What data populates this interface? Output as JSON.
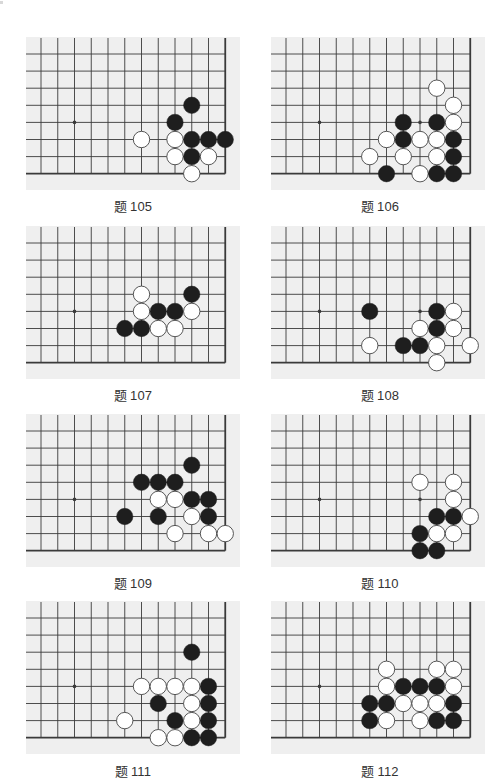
{
  "page": {
    "colors": {
      "board_bg": "#efefef",
      "grid": "#3a3a3a",
      "black_stone": "#1e1e1e",
      "white_stone": "#ffffff",
      "white_stone_border": "#444444",
      "label": "#333333"
    }
  },
  "board_spec": {
    "columns": 12,
    "rows": 8,
    "edges": [
      "right",
      "bottom"
    ],
    "star_points": [
      [
        2,
        4
      ]
    ]
  },
  "problems": [
    {
      "title_prefix": "题",
      "number": "105",
      "extra_dots": [],
      "stones": [
        {
          "c": 9,
          "r": 3,
          "color": "black"
        },
        {
          "c": 8,
          "r": 4,
          "color": "black"
        },
        {
          "c": 6,
          "r": 5,
          "color": "white"
        },
        {
          "c": 8,
          "r": 5,
          "color": "white"
        },
        {
          "c": 9,
          "r": 5,
          "color": "black"
        },
        {
          "c": 10,
          "r": 5,
          "color": "black"
        },
        {
          "c": 11,
          "r": 5,
          "color": "black"
        },
        {
          "c": 8,
          "r": 6,
          "color": "white"
        },
        {
          "c": 9,
          "r": 6,
          "color": "black"
        },
        {
          "c": 10,
          "r": 6,
          "color": "white"
        },
        {
          "c": 9,
          "r": 7,
          "color": "white"
        }
      ]
    },
    {
      "title_prefix": "题",
      "number": "106",
      "extra_dots": [
        [
          8,
          4
        ]
      ],
      "stones": [
        {
          "c": 9,
          "r": 2,
          "color": "white"
        },
        {
          "c": 10,
          "r": 3,
          "color": "white"
        },
        {
          "c": 7,
          "r": 4,
          "color": "black"
        },
        {
          "c": 9,
          "r": 4,
          "color": "black"
        },
        {
          "c": 10,
          "r": 4,
          "color": "white"
        },
        {
          "c": 6,
          "r": 5,
          "color": "white"
        },
        {
          "c": 7,
          "r": 5,
          "color": "black"
        },
        {
          "c": 8,
          "r": 5,
          "color": "white"
        },
        {
          "c": 9,
          "r": 5,
          "color": "white"
        },
        {
          "c": 10,
          "r": 5,
          "color": "black"
        },
        {
          "c": 5,
          "r": 6,
          "color": "white"
        },
        {
          "c": 7,
          "r": 6,
          "color": "white"
        },
        {
          "c": 9,
          "r": 6,
          "color": "white"
        },
        {
          "c": 10,
          "r": 6,
          "color": "black"
        },
        {
          "c": 6,
          "r": 7,
          "color": "black"
        },
        {
          "c": 8,
          "r": 7,
          "color": "white"
        },
        {
          "c": 9,
          "r": 7,
          "color": "black"
        },
        {
          "c": 10,
          "r": 7,
          "color": "black"
        }
      ]
    },
    {
      "title_prefix": "题",
      "number": "107",
      "extra_dots": [],
      "stones": [
        {
          "c": 6,
          "r": 3,
          "color": "white"
        },
        {
          "c": 9,
          "r": 3,
          "color": "black"
        },
        {
          "c": 6,
          "r": 4,
          "color": "white"
        },
        {
          "c": 7,
          "r": 4,
          "color": "black"
        },
        {
          "c": 8,
          "r": 4,
          "color": "black"
        },
        {
          "c": 9,
          "r": 4,
          "color": "white"
        },
        {
          "c": 5,
          "r": 5,
          "color": "black"
        },
        {
          "c": 6,
          "r": 5,
          "color": "black"
        },
        {
          "c": 7,
          "r": 5,
          "color": "white"
        },
        {
          "c": 8,
          "r": 5,
          "color": "white"
        }
      ]
    },
    {
      "title_prefix": "题",
      "number": "108",
      "extra_dots": [
        [
          8,
          4
        ]
      ],
      "stones": [
        {
          "c": 5,
          "r": 4,
          "color": "black"
        },
        {
          "c": 9,
          "r": 4,
          "color": "black"
        },
        {
          "c": 10,
          "r": 4,
          "color": "white"
        },
        {
          "c": 8,
          "r": 5,
          "color": "white"
        },
        {
          "c": 9,
          "r": 5,
          "color": "black"
        },
        {
          "c": 10,
          "r": 5,
          "color": "white"
        },
        {
          "c": 5,
          "r": 6,
          "color": "white"
        },
        {
          "c": 7,
          "r": 6,
          "color": "black"
        },
        {
          "c": 8,
          "r": 6,
          "color": "black"
        },
        {
          "c": 9,
          "r": 6,
          "color": "white"
        },
        {
          "c": 11,
          "r": 6,
          "color": "white"
        },
        {
          "c": 9,
          "r": 7,
          "color": "white"
        }
      ]
    },
    {
      "title_prefix": "题",
      "number": "109",
      "extra_dots": [],
      "stones": [
        {
          "c": 9,
          "r": 2,
          "color": "black"
        },
        {
          "c": 6,
          "r": 3,
          "color": "black"
        },
        {
          "c": 7,
          "r": 3,
          "color": "black"
        },
        {
          "c": 8,
          "r": 3,
          "color": "black"
        },
        {
          "c": 7,
          "r": 4,
          "color": "white"
        },
        {
          "c": 8,
          "r": 4,
          "color": "white"
        },
        {
          "c": 9,
          "r": 4,
          "color": "black"
        },
        {
          "c": 10,
          "r": 4,
          "color": "black"
        },
        {
          "c": 5,
          "r": 5,
          "color": "black"
        },
        {
          "c": 7,
          "r": 5,
          "color": "black"
        },
        {
          "c": 9,
          "r": 5,
          "color": "white"
        },
        {
          "c": 10,
          "r": 5,
          "color": "black"
        },
        {
          "c": 8,
          "r": 6,
          "color": "white"
        },
        {
          "c": 10,
          "r": 6,
          "color": "white"
        },
        {
          "c": 11,
          "r": 6,
          "color": "white"
        }
      ]
    },
    {
      "title_prefix": "题",
      "number": "110",
      "extra_dots": [
        [
          8,
          4
        ]
      ],
      "stones": [
        {
          "c": 8,
          "r": 3,
          "color": "white"
        },
        {
          "c": 10,
          "r": 3,
          "color": "white"
        },
        {
          "c": 10,
          "r": 4,
          "color": "white"
        },
        {
          "c": 9,
          "r": 5,
          "color": "black"
        },
        {
          "c": 10,
          "r": 5,
          "color": "black"
        },
        {
          "c": 11,
          "r": 5,
          "color": "white"
        },
        {
          "c": 8,
          "r": 6,
          "color": "black"
        },
        {
          "c": 9,
          "r": 6,
          "color": "white"
        },
        {
          "c": 10,
          "r": 6,
          "color": "white"
        },
        {
          "c": 8,
          "r": 7,
          "color": "black"
        },
        {
          "c": 9,
          "r": 7,
          "color": "black"
        }
      ]
    },
    {
      "title_prefix": "题",
      "number": "111",
      "extra_dots": [],
      "stones": [
        {
          "c": 9,
          "r": 2,
          "color": "black"
        },
        {
          "c": 6,
          "r": 4,
          "color": "white"
        },
        {
          "c": 7,
          "r": 4,
          "color": "white"
        },
        {
          "c": 8,
          "r": 4,
          "color": "white"
        },
        {
          "c": 9,
          "r": 4,
          "color": "white"
        },
        {
          "c": 10,
          "r": 4,
          "color": "black"
        },
        {
          "c": 7,
          "r": 5,
          "color": "black"
        },
        {
          "c": 9,
          "r": 5,
          "color": "white"
        },
        {
          "c": 10,
          "r": 5,
          "color": "black"
        },
        {
          "c": 5,
          "r": 6,
          "color": "white"
        },
        {
          "c": 8,
          "r": 6,
          "color": "black"
        },
        {
          "c": 9,
          "r": 6,
          "color": "white"
        },
        {
          "c": 10,
          "r": 6,
          "color": "black"
        },
        {
          "c": 7,
          "r": 7,
          "color": "white"
        },
        {
          "c": 8,
          "r": 7,
          "color": "white"
        },
        {
          "c": 9,
          "r": 7,
          "color": "black"
        },
        {
          "c": 10,
          "r": 7,
          "color": "black"
        }
      ]
    },
    {
      "title_prefix": "题",
      "number": "112",
      "extra_dots": [],
      "stones": [
        {
          "c": 6,
          "r": 3,
          "color": "white"
        },
        {
          "c": 9,
          "r": 3,
          "color": "white"
        },
        {
          "c": 10,
          "r": 3,
          "color": "white"
        },
        {
          "c": 6,
          "r": 4,
          "color": "white"
        },
        {
          "c": 7,
          "r": 4,
          "color": "black"
        },
        {
          "c": 8,
          "r": 4,
          "color": "black"
        },
        {
          "c": 9,
          "r": 4,
          "color": "black"
        },
        {
          "c": 10,
          "r": 4,
          "color": "white"
        },
        {
          "c": 5,
          "r": 5,
          "color": "black"
        },
        {
          "c": 6,
          "r": 5,
          "color": "black"
        },
        {
          "c": 7,
          "r": 5,
          "color": "white"
        },
        {
          "c": 8,
          "r": 5,
          "color": "white"
        },
        {
          "c": 9,
          "r": 5,
          "color": "white"
        },
        {
          "c": 10,
          "r": 5,
          "color": "black"
        },
        {
          "c": 5,
          "r": 6,
          "color": "black"
        },
        {
          "c": 6,
          "r": 6,
          "color": "white"
        },
        {
          "c": 8,
          "r": 6,
          "color": "white"
        },
        {
          "c": 9,
          "r": 6,
          "color": "black"
        },
        {
          "c": 10,
          "r": 6,
          "color": "black"
        }
      ]
    }
  ]
}
